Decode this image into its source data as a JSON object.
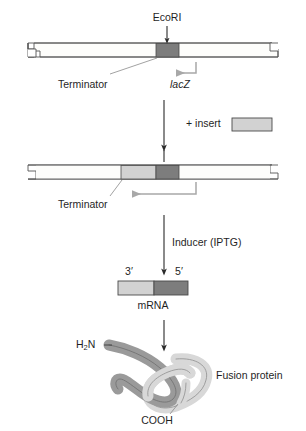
{
  "figure": {
    "type": "molecular-biology-process-diagram",
    "background": "#ffffff",
    "ink": "#1f1f1f"
  },
  "colors": {
    "dark_gray_lacZ": "#7d7d7d",
    "light_gray_insert": "#d2d2d2",
    "vector_fill": "#fdfdfb",
    "outline": "#4a4a4a",
    "protein_dark": "#9a9a9a",
    "protein_light": "#d8d8d8",
    "leader_line": "#8a8a8a",
    "promoter_arrow": "#a8a8a8"
  },
  "steps": [
    {
      "id": "step-vector",
      "name": "linearized-vector",
      "labels": {
        "restriction_site": "EcoRI",
        "terminator": "Terminator",
        "gene": "lacZ"
      }
    },
    {
      "id": "step-ligation",
      "name": "insert-ligation",
      "labels": {
        "operation": "+ insert"
      }
    },
    {
      "id": "step-recombinant",
      "name": "recombinant-vector",
      "labels": {
        "terminator": "Terminator"
      }
    },
    {
      "id": "step-induction",
      "name": "induction",
      "labels": {
        "inducer": "Inducer (IPTG)"
      }
    },
    {
      "id": "step-transcript",
      "name": "mrna-transcript",
      "labels": {
        "three_prime": "3′",
        "five_prime": "5′",
        "molecule": "mRNA"
      }
    },
    {
      "id": "step-protein",
      "name": "fusion-protein",
      "labels": {
        "n_terminus_prefix": "H",
        "n_terminus_sub": "2",
        "n_terminus_suffix": "N",
        "c_terminus": "COOH",
        "product": "Fusion protein"
      }
    }
  ]
}
